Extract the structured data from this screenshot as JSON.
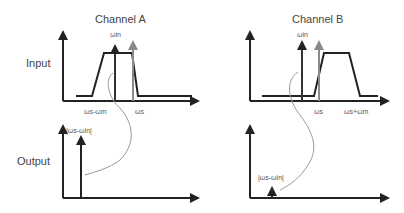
{
  "diagram": {
    "channels": [
      {
        "title": "Channel A",
        "input_labels": {
          "carrier_in": "ωin",
          "tick_low": "ωs-ωm",
          "tick_high": "ωs"
        },
        "output_labels": {
          "beat": "|ωs-ωin|"
        }
      },
      {
        "title": "Channel B",
        "input_labels": {
          "carrier_in": "ωin",
          "tick_low": "ωs",
          "tick_high": "ωs+ωm"
        },
        "output_labels": {
          "beat": "|ωs-ωin|"
        }
      }
    ],
    "rows": {
      "input": "Input",
      "output": "Output"
    },
    "colors": {
      "axis": "#222222",
      "signal": "#333333",
      "reference": "#8a8a8a",
      "mapping_curve": "#9a9a9a"
    }
  }
}
